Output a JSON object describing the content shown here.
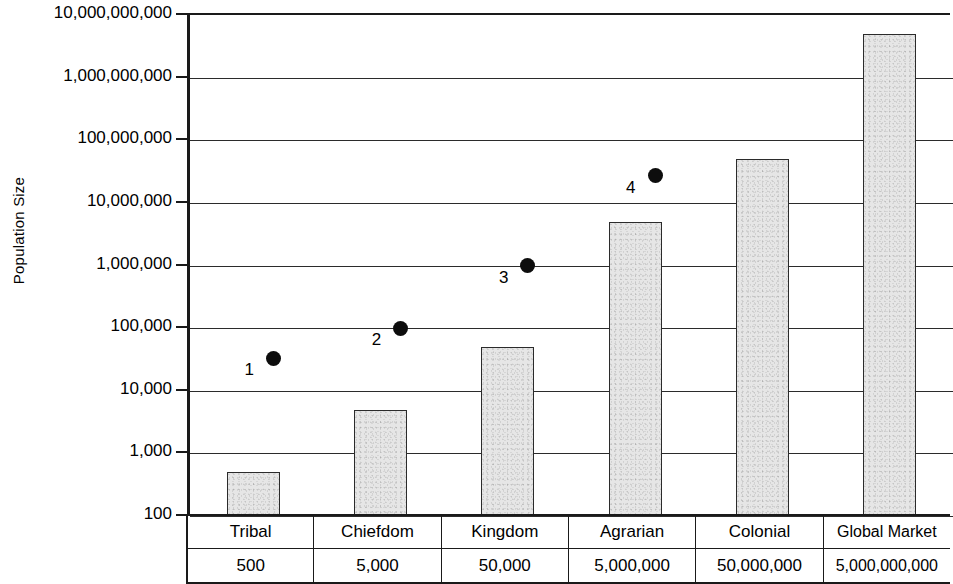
{
  "chart_data": {
    "type": "bar",
    "title": "",
    "xlabel": "",
    "ylabel": "Population Size",
    "yscale": "log",
    "ylim": [
      100,
      10000000000
    ],
    "grid": true,
    "legend": "none",
    "categories": [
      "Tribal",
      "Chiefdom",
      "Kingdom",
      "Agrarian",
      "Colonial",
      "Global Market"
    ],
    "value_labels": [
      "500",
      "5,000",
      "50,000",
      "5,000,000",
      "50,000,000",
      "5,000,000,000"
    ],
    "values": [
      500,
      5000,
      50000,
      5000000,
      50000000,
      5000000000
    ],
    "ytick_labels": [
      "10,000,000,000",
      "1,000,000,000",
      "100,000,000",
      "10,000,000",
      "1,000,000",
      "100,000",
      "10,000",
      "1,000",
      "100"
    ],
    "ytick_values": [
      10000000000,
      1000000000,
      100000000,
      10000000,
      1000000,
      100000,
      10000,
      1000,
      100
    ],
    "series": [
      {
        "name": "population",
        "type": "bar",
        "values": [
          500,
          5000,
          50000,
          5000000,
          50000000,
          5000000000
        ]
      },
      {
        "name": "annotated-points",
        "type": "scatter",
        "points": [
          {
            "label": "1",
            "category": "Tribal",
            "value": 33000
          },
          {
            "label": "2",
            "category": "Chiefdom",
            "value": 100000
          },
          {
            "label": "3",
            "category": "Kingdom",
            "value": 1000000
          },
          {
            "label": "4",
            "category": "Agrarian",
            "value": 27000000
          }
        ]
      }
    ],
    "colors": {
      "bar_fill": "#e6e6e6",
      "bar_stroke": "#2b2b2b",
      "grid": "#2b2b2b",
      "axis": "#1a1a1a",
      "marker": "#0d0d0d",
      "background": "#ffffff"
    }
  }
}
